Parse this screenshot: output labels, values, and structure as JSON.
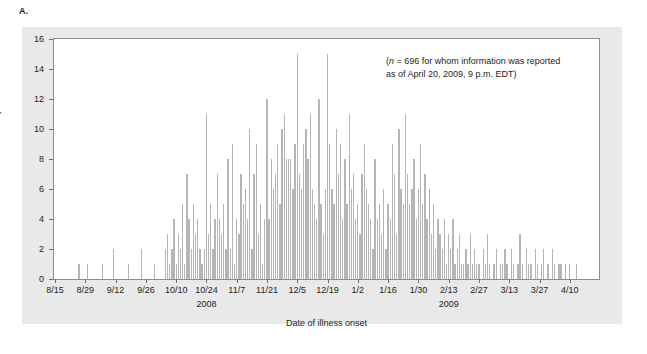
{
  "panel": {
    "label": "A."
  },
  "annotation": {
    "line1_prefix": "(",
    "n_symbol": "n",
    "line1": "(n = 696 for whom information was reported",
    "line2": "as of April 20, 2009, 9 p.m. EDT)",
    "full": "(n = 696 for whom information was reported as of April 20, 2009, 9 p.m. EDT)"
  },
  "colors": {
    "bar": "#b5b5b5",
    "panel_background": "#e9e9e9",
    "plot_background": "#ffffff",
    "axis": "#8d8d8d",
    "text": "#231f20"
  },
  "chart_data": {
    "type": "bar",
    "title": "",
    "subtitle": "",
    "xlabel": "Date of illness onset",
    "ylabel": "Number of persons",
    "ylim": [
      0,
      16
    ],
    "ytick_labels": [
      "0",
      "2",
      "4",
      "6",
      "8",
      "10",
      "12",
      "14",
      "16"
    ],
    "ytick_values": [
      0,
      2,
      4,
      6,
      8,
      10,
      12,
      14,
      16
    ],
    "grid": false,
    "legend": "none",
    "annotations": [
      "(n = 696 for whom information was reported as of April 20, 2009, 9 p.m. EDT)"
    ],
    "xtick_labels": [
      "8/15",
      "8/29",
      "9/12",
      "9/26",
      "10/10",
      "10/24",
      "11/7",
      "11/21",
      "12/5",
      "12/19",
      "1/2",
      "1/16",
      "1/30",
      "2/13",
      "2/27",
      "3/13",
      "3/27",
      "4/10"
    ],
    "xtick_day_indexes": [
      0,
      14,
      28,
      42,
      56,
      70,
      84,
      98,
      112,
      126,
      140,
      154,
      168,
      182,
      196,
      210,
      224,
      238
    ],
    "year_group_labels": [
      "2008",
      "2009"
    ],
    "year_group_day_indexes": [
      70,
      182
    ],
    "x_start_date": "8/15",
    "x_end_date": "4/10",
    "bin": "day",
    "n_total": 696,
    "values": [
      0,
      0,
      0,
      0,
      0,
      0,
      0,
      0,
      0,
      0,
      0,
      1,
      0,
      0,
      0,
      1,
      0,
      0,
      0,
      0,
      0,
      0,
      1,
      0,
      0,
      0,
      0,
      2,
      0,
      0,
      0,
      0,
      0,
      0,
      1,
      0,
      0,
      0,
      0,
      0,
      2,
      0,
      0,
      0,
      0,
      0,
      1,
      0,
      0,
      0,
      0,
      2,
      3,
      1,
      2,
      4,
      1,
      3,
      2,
      5,
      1,
      7,
      4,
      2,
      5,
      3,
      4,
      2,
      1,
      2,
      11,
      3,
      5,
      2,
      4,
      7,
      4,
      3,
      5,
      2,
      8,
      2,
      9,
      1,
      4,
      3,
      7,
      5,
      6,
      4,
      10,
      2,
      7,
      9,
      3,
      5,
      1,
      4,
      12,
      4,
      8,
      6,
      7,
      9,
      5,
      10,
      11,
      8,
      8,
      8,
      6,
      9,
      15,
      7,
      6,
      9,
      10,
      8,
      11,
      6,
      5,
      4,
      12,
      5,
      3,
      6,
      15,
      9,
      6,
      5,
      10,
      7,
      9,
      4,
      8,
      5,
      11,
      6,
      7,
      4,
      5,
      3,
      7,
      9,
      6,
      5,
      4,
      2,
      8,
      4,
      5,
      3,
      6,
      2,
      5,
      4,
      9,
      7,
      3,
      10,
      6,
      5,
      11,
      7,
      5,
      6,
      8,
      4,
      6,
      9,
      5,
      7,
      4,
      6,
      3,
      5,
      2,
      4,
      3,
      2,
      4,
      1,
      3,
      2,
      4,
      1,
      2,
      3,
      1,
      1,
      2,
      1,
      3,
      1,
      2,
      1,
      1,
      0,
      2,
      1,
      3,
      1,
      0,
      1,
      2,
      0,
      1,
      1,
      2,
      1,
      0,
      2,
      1,
      0,
      1,
      3,
      1,
      0,
      2,
      1,
      1,
      0,
      2,
      1,
      0,
      1,
      2,
      0,
      1,
      0,
      2,
      1,
      0,
      1,
      1,
      0,
      1,
      0,
      1,
      0,
      0,
      1,
      0,
      0,
      0,
      0,
      0,
      0,
      0,
      0,
      0,
      0
    ]
  }
}
